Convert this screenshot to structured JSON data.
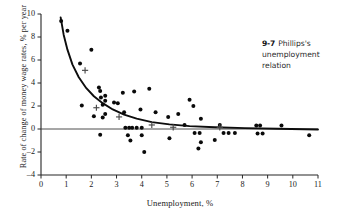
{
  "figure": {
    "caption_number": "9-7",
    "caption_text": "Phillips's unemployment relation"
  },
  "chart_data": {
    "type": "scatter",
    "title": "",
    "xlabel": "Unemployment, %",
    "ylabel": "Rate of change of money wage rates, % per year",
    "xlim": [
      0,
      11
    ],
    "ylim": [
      -4,
      10
    ],
    "xticks": [
      0,
      1,
      2,
      3,
      4,
      5,
      6,
      7,
      8,
      9,
      10,
      11
    ],
    "yticks": [
      -4,
      -2,
      0,
      2,
      4,
      6,
      8,
      10
    ],
    "grid": false,
    "legend": null,
    "zero_line": 0,
    "series": [
      {
        "name": "Observations",
        "marker": "filled-circle",
        "points": [
          [
            0.8,
            9.4
          ],
          [
            1.05,
            8.55
          ],
          [
            1.55,
            5.7
          ],
          [
            2.0,
            6.9
          ],
          [
            2.3,
            3.6
          ],
          [
            2.35,
            3.3
          ],
          [
            2.38,
            2.75
          ],
          [
            2.55,
            2.9
          ],
          [
            3.25,
            3.15
          ],
          [
            3.7,
            3.25
          ],
          [
            4.3,
            3.5
          ],
          [
            1.62,
            2.05
          ],
          [
            2.45,
            2.1
          ],
          [
            2.55,
            2.45
          ],
          [
            2.9,
            2.3
          ],
          [
            3.05,
            2.25
          ],
          [
            2.1,
            1.1
          ],
          [
            2.45,
            1.0
          ],
          [
            2.55,
            1.3
          ],
          [
            3.3,
            1.45
          ],
          [
            3.95,
            1.7
          ],
          [
            4.55,
            1.45
          ],
          [
            5.05,
            1.05
          ],
          [
            3.35,
            0.1
          ],
          [
            3.5,
            0.1
          ],
          [
            3.62,
            0.1
          ],
          [
            3.8,
            0.1
          ],
          [
            4.0,
            0.1
          ],
          [
            2.35,
            -0.5
          ],
          [
            3.45,
            -0.55
          ],
          [
            3.55,
            -1.0
          ],
          [
            4.0,
            -0.55
          ],
          [
            5.1,
            -0.8
          ],
          [
            4.1,
            -2.0
          ],
          [
            5.45,
            1.3
          ],
          [
            5.9,
            2.55
          ],
          [
            6.05,
            2.0
          ],
          [
            5.7,
            0.35
          ],
          [
            6.35,
            0.9
          ],
          [
            6.1,
            -0.35
          ],
          [
            6.3,
            -0.35
          ],
          [
            6.35,
            -1.15
          ],
          [
            6.25,
            -1.7
          ],
          [
            7.1,
            0.35
          ],
          [
            7.25,
            -0.35
          ],
          [
            7.45,
            -0.35
          ],
          [
            7.7,
            -0.35
          ],
          [
            6.9,
            -0.95
          ],
          [
            8.55,
            0.3
          ],
          [
            8.7,
            0.3
          ],
          [
            8.6,
            -0.4
          ],
          [
            8.8,
            -0.4
          ],
          [
            9.55,
            0.3
          ],
          [
            10.65,
            -0.55
          ]
        ]
      },
      {
        "name": "Decade averages",
        "marker": "plus",
        "points": [
          [
            1.75,
            5.1
          ],
          [
            2.2,
            1.85
          ],
          [
            3.1,
            1.05
          ],
          [
            4.4,
            0.35
          ],
          [
            5.25,
            0.15
          ],
          [
            7.1,
            0.15
          ]
        ]
      }
    ],
    "fitted_curve": {
      "name": "Phillips curve fit",
      "points": [
        [
          0.78,
          9.7
        ],
        [
          0.9,
          8.2
        ],
        [
          1.05,
          6.9
        ],
        [
          1.25,
          5.6
        ],
        [
          1.5,
          4.5
        ],
        [
          1.8,
          3.55
        ],
        [
          2.1,
          2.85
        ],
        [
          2.45,
          2.25
        ],
        [
          2.85,
          1.7
        ],
        [
          3.3,
          1.25
        ],
        [
          3.8,
          0.9
        ],
        [
          4.4,
          0.6
        ],
        [
          5.1,
          0.4
        ],
        [
          5.9,
          0.25
        ],
        [
          6.9,
          0.15
        ],
        [
          8.1,
          0.08
        ],
        [
          9.4,
          0.02
        ],
        [
          11.0,
          -0.05
        ]
      ]
    }
  }
}
